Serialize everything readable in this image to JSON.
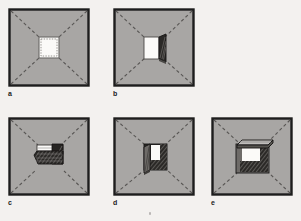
{
  "figure": {
    "title": "",
    "background_color": "#f3f1ef",
    "panel_fill": "#a8a6a4",
    "panel_border": "#1d1d1d",
    "diagonal_color": "#5a5856",
    "opening_white": "#fbfaf8",
    "door_dark": "#262422",
    "door_mid": "#6e6b68",
    "hatch_color": "#2a2826",
    "panels": [
      {
        "id": "a",
        "label": "a",
        "caption": "closed central opening with dashed outline",
        "opening_state": "closed",
        "x": 8,
        "y": 8,
        "w": 82,
        "h": 79
      },
      {
        "id": "b",
        "label": "b",
        "caption": "opening with single leaf swung outward to the right",
        "opening_state": "door-right",
        "x": 113,
        "y": 8,
        "w": 82,
        "h": 79
      },
      {
        "id": "c",
        "label": "c",
        "caption": "opening shown obliquely with hatched flap laid flat",
        "opening_state": "flap-flat",
        "x": 8,
        "y": 117,
        "w": 82,
        "h": 79
      },
      {
        "id": "d",
        "label": "d",
        "caption": "opening with single leaf swung outward to the left",
        "opening_state": "door-left",
        "x": 113,
        "y": 117,
        "w": 82,
        "h": 79
      },
      {
        "id": "e",
        "label": "e",
        "caption": "opening with projecting awning canopy above",
        "opening_state": "awning",
        "x": 211,
        "y": 117,
        "w": 82,
        "h": 79
      }
    ]
  }
}
